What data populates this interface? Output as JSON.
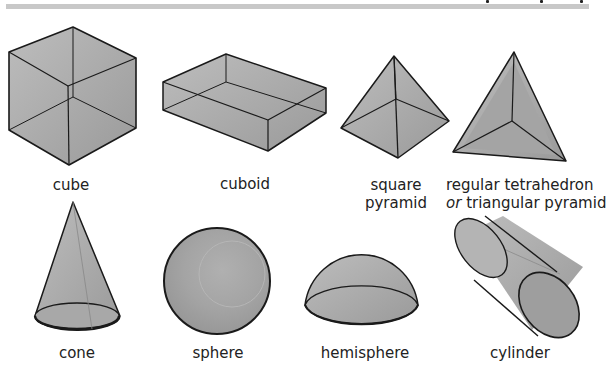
{
  "shapes": {
    "cube": {
      "label": "cube"
    },
    "cuboid": {
      "label": "cuboid"
    },
    "square_pyramid": {
      "line1": "square",
      "line2": "pyramid"
    },
    "tetrahedron": {
      "line1": "regular tetrahedron",
      "line2_italic": "or",
      "line2_rest": " triangular pyramid"
    },
    "cone": {
      "label": "cone"
    },
    "sphere": {
      "label": "sphere"
    },
    "hemisphere": {
      "label": "hemisphere"
    },
    "cylinder": {
      "label": "cylinder"
    }
  },
  "colors": {
    "fill": "#a9a9a9",
    "stroke": "#1a1a1a",
    "header_bar": "#c8c8c8"
  }
}
